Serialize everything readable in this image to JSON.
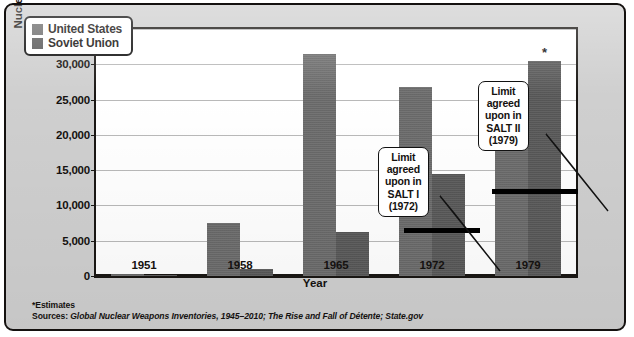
{
  "chart_data": {
    "type": "bar",
    "title": "",
    "xlabel": "Year",
    "ylabel": "Nuclear warheads",
    "categories": [
      "1951",
      "1958",
      "1965",
      "1972",
      "1979"
    ],
    "series": [
      {
        "name": "United States",
        "color": "#6d6d6d",
        "values": [
          300,
          7500,
          31500,
          26800,
          24500
        ]
      },
      {
        "name": "Soviet Union",
        "color": "#5a5a5a",
        "values": [
          50,
          1050,
          6200,
          14500,
          30500
        ]
      }
    ],
    "ylim": [
      0,
      35000
    ],
    "ytick_values": [
      0,
      5000,
      10000,
      15000,
      20000,
      25000,
      30000,
      35000
    ],
    "ytick_labels": [
      "0",
      "5,000",
      "10,000",
      "15,000",
      "20,000",
      "25,000",
      "30,000",
      "35,000"
    ],
    "grid": true,
    "legend_position": "top-left",
    "annotations": [
      {
        "id": "salt1",
        "text_lines": [
          "Limit",
          "agreed",
          "upon in",
          "SALT I",
          "(1972)"
        ],
        "limit_value": 6500,
        "applies_to_category": "1972"
      },
      {
        "id": "salt2",
        "text_lines": [
          "Limit",
          "agreed",
          "upon in",
          "SALT II",
          "(1979)"
        ],
        "limit_value": 12000,
        "applies_to_category": "1979"
      }
    ],
    "starred_points": [
      {
        "category": "1979",
        "series": "United States",
        "marker": "*"
      },
      {
        "category": "1979",
        "series": "Soviet Union",
        "marker": "*"
      }
    ]
  },
  "legend": {
    "items": [
      {
        "label": "United States",
        "swatch": "us"
      },
      {
        "label": "Soviet Union",
        "swatch": "su"
      }
    ]
  },
  "footnotes": {
    "estimates": "*Estimates",
    "sources_lead": "Sources:",
    "sources_text": " Global Nuclear Weapons Inventories, 1945–2010; The Rise and Fall of Détente; State.gov"
  }
}
